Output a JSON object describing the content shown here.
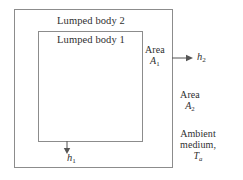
{
  "figure": {
    "type": "schematic-diagram",
    "background_color": "#ffffff",
    "line_color": "#8c8c8c",
    "arrow_color": "#555555",
    "text_color": "#2f2f2f"
  },
  "boxes": {
    "outer": {
      "label": "Lumped body 2",
      "x": 14,
      "y": 9,
      "width": 159,
      "height": 159
    },
    "inner": {
      "label": "Lumped body 1",
      "x": 38,
      "y": 31,
      "width": 105,
      "height": 111
    }
  },
  "labels": {
    "area1_line1": "Area",
    "area1_symbol": "A",
    "area1_subscript": "1",
    "area2_line1": "Area",
    "area2_symbol": "A",
    "area2_subscript": "2",
    "ambient_line1": "Ambient",
    "ambient_line2": "medium,",
    "ambient_symbol": "T",
    "ambient_subscript": "a"
  },
  "arrows": {
    "h2": {
      "symbol": "h",
      "subscript": "2",
      "direction": "right",
      "from": "outer-box-right-edge"
    },
    "h1": {
      "symbol": "h",
      "subscript": "1",
      "direction": "down",
      "from": "inner-box-bottom-edge"
    }
  }
}
